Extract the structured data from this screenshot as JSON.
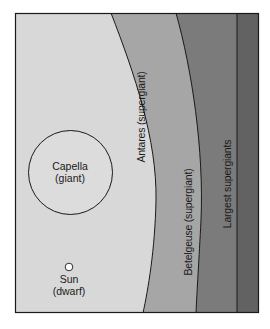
{
  "diagram": {
    "type": "star-size-comparison",
    "colors": {
      "background": "#ffffff",
      "dwarf_giant_region": "#d8d8d8",
      "antares_band": "#a6a6a6",
      "betelgeuse_band": "#7b7b7b",
      "largest_band": "#626262",
      "outline": "#1a1a1a",
      "star_fill": "#dcdcdc",
      "sun_fill": "#ffffff"
    },
    "stars": [
      {
        "name": "Capella",
        "class": "(giant)",
        "shape": "circle"
      },
      {
        "name": "Sun",
        "class": "(dwarf)",
        "shape": "circle"
      }
    ],
    "bands": [
      {
        "label": "Antares (supergiant)"
      },
      {
        "label": "Betelgeuse (supergiant)"
      },
      {
        "label": "Largest supergiants"
      }
    ]
  }
}
